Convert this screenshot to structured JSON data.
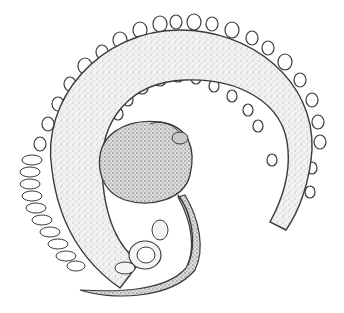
{
  "illustration": {
    "subject": "stippled drawing of a coiled worm-like organism wrapped around a snail shell",
    "colors": {
      "background": "#ffffff",
      "ink": "#3a3a3a",
      "stipple": "#8a8a8a",
      "shell_fill": "#d6d6d6",
      "body_fill": "#eeeeee"
    }
  }
}
